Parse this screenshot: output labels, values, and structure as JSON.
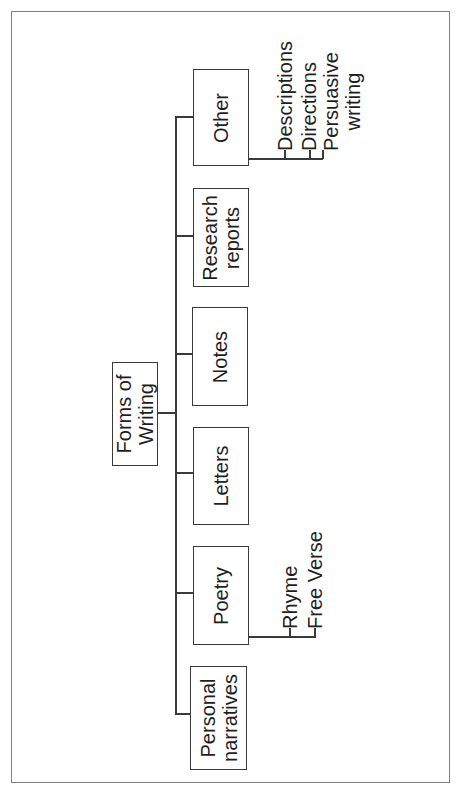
{
  "page": {
    "top_caption_cropped": ""
  },
  "diagram": {
    "root": {
      "label": "Forms of Writing",
      "lines": [
        "Forms of",
        "Writing"
      ]
    },
    "children": [
      {
        "label": "Other",
        "lines": [
          "Other"
        ],
        "subitems": [
          "Descriptions",
          "Directions",
          "Persuasive writing"
        ],
        "sub_lines": [
          [
            "Descriptions"
          ],
          [
            "Directions"
          ],
          [
            "Persuasive",
            "writing"
          ]
        ]
      },
      {
        "label": "Research reports",
        "lines": [
          "Research",
          "reports"
        ],
        "subitems": []
      },
      {
        "label": "Notes",
        "lines": [
          "Notes"
        ],
        "subitems": []
      },
      {
        "label": "Letters",
        "lines": [
          "Letters"
        ],
        "subitems": []
      },
      {
        "label": "Poetry",
        "lines": [
          "Poetry"
        ],
        "subitems": [
          "Rhyme",
          "Free Verse"
        ],
        "sub_lines": [
          [
            "Rhyme"
          ],
          [
            "Free Verse"
          ]
        ]
      },
      {
        "label": "Personal narratives",
        "lines": [
          "Personal",
          "narratives"
        ],
        "subitems": []
      }
    ],
    "colors": {
      "line": "#3a3a3a",
      "frame": "#808080",
      "background": "#ffffff"
    }
  }
}
